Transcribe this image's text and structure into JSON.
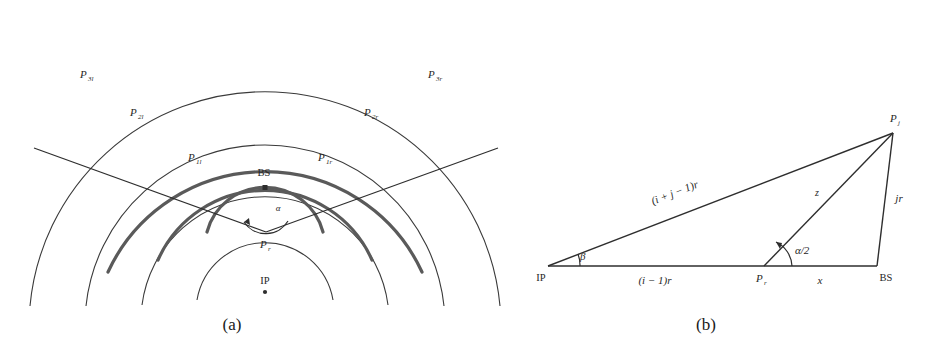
{
  "figure": {
    "panels": [
      {
        "id": "panel-a",
        "caption": "(a)",
        "description": "Concentric arc geometry with intersection points",
        "labels": {
          "bs": "BS",
          "ip": "IP",
          "pr": "P",
          "pr_sub": "r",
          "alpha": "α",
          "p1l": "P",
          "p1l_sub": "1l",
          "p2l": "P",
          "p2l_sub": "2l",
          "p3l": "P",
          "p3l_sub": "3l",
          "p1r": "P",
          "p1r_sub": "1r",
          "p2r": "P",
          "p2r_sub": "2r",
          "p3r": "P",
          "p3r_sub": "3r"
        }
      },
      {
        "id": "panel-b",
        "caption": "(b)",
        "description": "Triangle relating IP, P_r, BS and P_j",
        "labels": {
          "ip": "IP",
          "bs": "BS",
          "pr": "P",
          "pr_sub": "r",
          "pj": "P",
          "pj_sub": "j",
          "beta": "β",
          "alpha_half": "α/2",
          "side_long": "(i + j − 1)r",
          "side_base_left": "(i − 1)r",
          "side_base_right": "x",
          "side_slant": "z",
          "side_vertical": "jr"
        }
      }
    ],
    "colors": {
      "thick_arc": "#5a5a5a",
      "thin_arc": "#3a3a3a",
      "ray": "#2e2e2e",
      "text": "#262626",
      "background": "#ffffff"
    }
  }
}
